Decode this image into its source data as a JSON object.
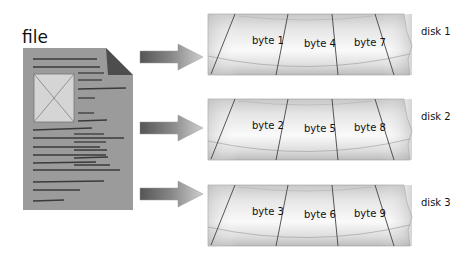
{
  "file": {
    "label": "file"
  },
  "disks": [
    {
      "label": "disk 1",
      "bytes": [
        "byte 1",
        "byte 4",
        "byte 7"
      ]
    },
    {
      "label": "disk 2",
      "bytes": [
        "byte 2",
        "byte 5",
        "byte 8"
      ]
    },
    {
      "label": "disk 3",
      "bytes": [
        "byte 3",
        "byte 6",
        "byte 9"
      ]
    }
  ],
  "colors": {
    "document": "#9a9a9a",
    "document_fold": "#4a4a4a",
    "image_placeholder": "#d6d6d6",
    "arrow_dark": "#5a5a5a",
    "arrow_light": "#c4c4c4",
    "platter_light": "#f4f4f4",
    "platter_dark": "#bdbdbd"
  }
}
